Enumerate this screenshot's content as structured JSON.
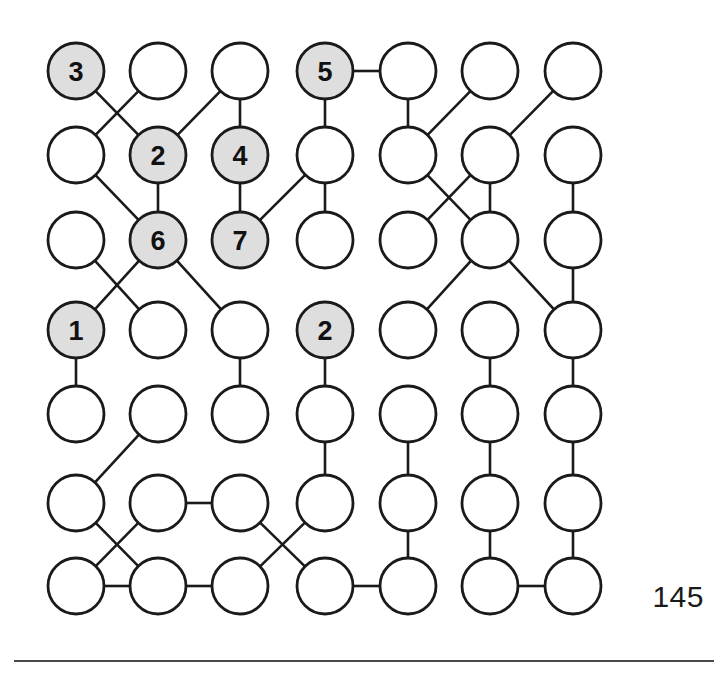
{
  "figure": {
    "type": "grid-graph",
    "rows": 7,
    "cols": 7,
    "node_radius": 28,
    "colors": {
      "shaded_fill": "#dedede",
      "plain_fill": "#ffffff",
      "stroke": "#1a1a1a",
      "page_number_color": "#1a1a1a",
      "rule_color": "#4a4a4a"
    },
    "geometry": {
      "x_positions": [
        76,
        158,
        240,
        325,
        408,
        490,
        573
      ],
      "y_positions": [
        71,
        155,
        240,
        330,
        414,
        503,
        586
      ]
    },
    "nodes": [
      {
        "id": "r1c1",
        "row": 1,
        "col": 1,
        "label": "3",
        "shaded": true
      },
      {
        "id": "r1c2",
        "row": 1,
        "col": 2,
        "label": "",
        "shaded": false
      },
      {
        "id": "r1c3",
        "row": 1,
        "col": 3,
        "label": "",
        "shaded": false
      },
      {
        "id": "r1c4",
        "row": 1,
        "col": 4,
        "label": "5",
        "shaded": true
      },
      {
        "id": "r1c5",
        "row": 1,
        "col": 5,
        "label": "",
        "shaded": false
      },
      {
        "id": "r1c6",
        "row": 1,
        "col": 6,
        "label": "",
        "shaded": false
      },
      {
        "id": "r1c7",
        "row": 1,
        "col": 7,
        "label": "",
        "shaded": false
      },
      {
        "id": "r2c1",
        "row": 2,
        "col": 1,
        "label": "",
        "shaded": false
      },
      {
        "id": "r2c2",
        "row": 2,
        "col": 2,
        "label": "2",
        "shaded": true
      },
      {
        "id": "r2c3",
        "row": 2,
        "col": 3,
        "label": "4",
        "shaded": true
      },
      {
        "id": "r2c4",
        "row": 2,
        "col": 4,
        "label": "",
        "shaded": false
      },
      {
        "id": "r2c5",
        "row": 2,
        "col": 5,
        "label": "",
        "shaded": false
      },
      {
        "id": "r2c6",
        "row": 2,
        "col": 6,
        "label": "",
        "shaded": false
      },
      {
        "id": "r2c7",
        "row": 2,
        "col": 7,
        "label": "",
        "shaded": false
      },
      {
        "id": "r3c1",
        "row": 3,
        "col": 1,
        "label": "",
        "shaded": false
      },
      {
        "id": "r3c2",
        "row": 3,
        "col": 2,
        "label": "6",
        "shaded": true
      },
      {
        "id": "r3c3",
        "row": 3,
        "col": 3,
        "label": "7",
        "shaded": true
      },
      {
        "id": "r3c4",
        "row": 3,
        "col": 4,
        "label": "",
        "shaded": false
      },
      {
        "id": "r3c5",
        "row": 3,
        "col": 5,
        "label": "",
        "shaded": false
      },
      {
        "id": "r3c6",
        "row": 3,
        "col": 6,
        "label": "",
        "shaded": false
      },
      {
        "id": "r3c7",
        "row": 3,
        "col": 7,
        "label": "",
        "shaded": false
      },
      {
        "id": "r4c1",
        "row": 4,
        "col": 1,
        "label": "1",
        "shaded": true
      },
      {
        "id": "r4c2",
        "row": 4,
        "col": 2,
        "label": "",
        "shaded": false
      },
      {
        "id": "r4c3",
        "row": 4,
        "col": 3,
        "label": "",
        "shaded": false
      },
      {
        "id": "r4c4",
        "row": 4,
        "col": 4,
        "label": "2",
        "shaded": true
      },
      {
        "id": "r4c5",
        "row": 4,
        "col": 5,
        "label": "",
        "shaded": false
      },
      {
        "id": "r4c6",
        "row": 4,
        "col": 6,
        "label": "",
        "shaded": false
      },
      {
        "id": "r4c7",
        "row": 4,
        "col": 7,
        "label": "",
        "shaded": false
      },
      {
        "id": "r5c1",
        "row": 5,
        "col": 1,
        "label": "",
        "shaded": false
      },
      {
        "id": "r5c2",
        "row": 5,
        "col": 2,
        "label": "",
        "shaded": false
      },
      {
        "id": "r5c3",
        "row": 5,
        "col": 3,
        "label": "",
        "shaded": false
      },
      {
        "id": "r5c4",
        "row": 5,
        "col": 4,
        "label": "",
        "shaded": false
      },
      {
        "id": "r5c5",
        "row": 5,
        "col": 5,
        "label": "",
        "shaded": false
      },
      {
        "id": "r5c6",
        "row": 5,
        "col": 6,
        "label": "",
        "shaded": false
      },
      {
        "id": "r5c7",
        "row": 5,
        "col": 7,
        "label": "",
        "shaded": false
      },
      {
        "id": "r6c1",
        "row": 6,
        "col": 1,
        "label": "",
        "shaded": false
      },
      {
        "id": "r6c2",
        "row": 6,
        "col": 2,
        "label": "",
        "shaded": false
      },
      {
        "id": "r6c3",
        "row": 6,
        "col": 3,
        "label": "",
        "shaded": false
      },
      {
        "id": "r6c4",
        "row": 6,
        "col": 4,
        "label": "",
        "shaded": false
      },
      {
        "id": "r6c5",
        "row": 6,
        "col": 5,
        "label": "",
        "shaded": false
      },
      {
        "id": "r6c6",
        "row": 6,
        "col": 6,
        "label": "",
        "shaded": false
      },
      {
        "id": "r6c7",
        "row": 6,
        "col": 7,
        "label": "",
        "shaded": false
      },
      {
        "id": "r7c1",
        "row": 7,
        "col": 1,
        "label": "",
        "shaded": false
      },
      {
        "id": "r7c2",
        "row": 7,
        "col": 2,
        "label": "",
        "shaded": false
      },
      {
        "id": "r7c3",
        "row": 7,
        "col": 3,
        "label": "",
        "shaded": false
      },
      {
        "id": "r7c4",
        "row": 7,
        "col": 4,
        "label": "",
        "shaded": false
      },
      {
        "id": "r7c5",
        "row": 7,
        "col": 5,
        "label": "",
        "shaded": false
      },
      {
        "id": "r7c6",
        "row": 7,
        "col": 6,
        "label": "",
        "shaded": false
      },
      {
        "id": "r7c7",
        "row": 7,
        "col": 7,
        "label": "",
        "shaded": false
      }
    ],
    "edges": [
      [
        "r1c1",
        "r2c2"
      ],
      [
        "r1c2",
        "r2c1"
      ],
      [
        "r1c3",
        "r2c2"
      ],
      [
        "r1c3",
        "r2c3"
      ],
      [
        "r1c4",
        "r1c5"
      ],
      [
        "r1c4",
        "r2c4"
      ],
      [
        "r1c5",
        "r2c5"
      ],
      [
        "r1c6",
        "r2c5"
      ],
      [
        "r1c7",
        "r2c6"
      ],
      [
        "r2c1",
        "r3c2"
      ],
      [
        "r2c2",
        "r3c2"
      ],
      [
        "r2c3",
        "r3c3"
      ],
      [
        "r2c4",
        "r3c3"
      ],
      [
        "r2c4",
        "r3c4"
      ],
      [
        "r2c5",
        "r3c6"
      ],
      [
        "r2c6",
        "r3c5"
      ],
      [
        "r2c6",
        "r3c6"
      ],
      [
        "r2c7",
        "r3c7"
      ],
      [
        "r3c1",
        "r4c2"
      ],
      [
        "r3c2",
        "r4c1"
      ],
      [
        "r3c2",
        "r4c3"
      ],
      [
        "r3c6",
        "r4c5"
      ],
      [
        "r3c6",
        "r4c7"
      ],
      [
        "r3c7",
        "r4c7"
      ],
      [
        "r4c1",
        "r5c1"
      ],
      [
        "r4c3",
        "r5c3"
      ],
      [
        "r4c4",
        "r5c4"
      ],
      [
        "r4c6",
        "r5c6"
      ],
      [
        "r4c7",
        "r5c7"
      ],
      [
        "r5c2",
        "r6c1"
      ],
      [
        "r5c4",
        "r6c4"
      ],
      [
        "r5c5",
        "r6c5"
      ],
      [
        "r5c6",
        "r6c6"
      ],
      [
        "r5c7",
        "r6c7"
      ],
      [
        "r6c1",
        "r7c2"
      ],
      [
        "r6c2",
        "r6c3"
      ],
      [
        "r6c2",
        "r7c1"
      ],
      [
        "r6c3",
        "r7c4"
      ],
      [
        "r6c4",
        "r7c3"
      ],
      [
        "r6c5",
        "r7c5"
      ],
      [
        "r6c6",
        "r7c6"
      ],
      [
        "r6c7",
        "r7c7"
      ],
      [
        "r7c1",
        "r7c2"
      ],
      [
        "r7c2",
        "r7c3"
      ],
      [
        "r7c4",
        "r7c5"
      ],
      [
        "r7c6",
        "r7c7"
      ]
    ]
  },
  "page": {
    "page_number": "145"
  }
}
